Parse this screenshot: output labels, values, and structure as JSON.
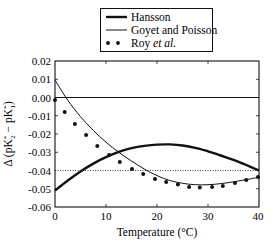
{
  "chart_data": {
    "type": "line",
    "title": "",
    "xlabel": "Temperature (°C)",
    "ylabel": "Δ (pK2* − pK1*)",
    "xlim": [
      0,
      40
    ],
    "ylim": [
      -0.06,
      0.02
    ],
    "xticks": [
      "0",
      "10",
      "20",
      "30",
      "40"
    ],
    "yticks": [
      "0.02",
      "0.01",
      "0.00",
      "-0.01",
      "-0.02",
      "-0.03",
      "-0.04",
      "-0.05",
      "-0.06"
    ],
    "reference_lines": [
      {
        "y": 0.0,
        "style": "solid"
      },
      {
        "y": -0.04,
        "style": "dotted"
      }
    ],
    "legend": {
      "position": "top-center",
      "entries": [
        "Hansson",
        "Goyet and Poisson",
        "Roy et al."
      ]
    },
    "series": [
      {
        "name": "Hansson",
        "style": "thick-line",
        "x": [
          0,
          2.5,
          5,
          7.5,
          10,
          12.5,
          15,
          17.5,
          20,
          22.5,
          25,
          27.5,
          30,
          32.5,
          35,
          37.5,
          40
        ],
        "values": [
          -0.051,
          -0.0455,
          -0.0405,
          -0.0362,
          -0.0327,
          -0.0298,
          -0.0278,
          -0.0265,
          -0.0258,
          -0.0257,
          -0.0263,
          -0.0276,
          -0.0295,
          -0.0318,
          -0.0342,
          -0.037,
          -0.04
        ]
      },
      {
        "name": "Goyet and Poisson",
        "style": "thin-line",
        "x": [
          0,
          2.5,
          5,
          7.5,
          10,
          12.5,
          15,
          17.5,
          20,
          22.5,
          25,
          27.5,
          30,
          32.5,
          35,
          37.5,
          40
        ],
        "values": [
          0.0095,
          -0.0015,
          -0.0105,
          -0.018,
          -0.0245,
          -0.03,
          -0.0348,
          -0.0392,
          -0.0428,
          -0.0455,
          -0.047,
          -0.0478,
          -0.0478,
          -0.0472,
          -0.0462,
          -0.045,
          -0.0437
        ]
      },
      {
        "name": "Roy et al.",
        "style": "dots",
        "x": [
          0,
          1.9,
          3.9,
          6.1,
          8.3,
          10.6,
          12.7,
          15.1,
          17.3,
          19.6,
          21.8,
          24.1,
          26.3,
          28.4,
          30.8,
          32.9,
          35.3,
          37.5,
          39.8
        ],
        "values": [
          -0.0014,
          -0.008,
          -0.0145,
          -0.0205,
          -0.0266,
          -0.0315,
          -0.0353,
          -0.0392,
          -0.0419,
          -0.0447,
          -0.0463,
          -0.0477,
          -0.049,
          -0.0493,
          -0.049,
          -0.0485,
          -0.0468,
          -0.0452,
          -0.0436
        ]
      }
    ]
  },
  "legend": {
    "items": [
      {
        "label": "Hansson"
      },
      {
        "label": "Goyet and Poisson"
      },
      {
        "label_main": "Roy ",
        "label_italic": "et al."
      }
    ]
  },
  "axes": {
    "xlabel": "Temperature (°C)",
    "ylabel_prefix": "Δ (pK",
    "ylabel_sub1": "2",
    "ylabel_sup1": "*",
    "ylabel_mid": " − pK",
    "ylabel_sub2": "1",
    "ylabel_sup2": "*",
    "ylabel_suffix": ")",
    "xticks": [
      "0",
      "10",
      "20",
      "30",
      "40"
    ],
    "yticks": [
      "0.02",
      "0.01",
      "0.00",
      "-0.01",
      "-0.02",
      "-0.03",
      "-0.04",
      "-0.05",
      "-0.06"
    ]
  }
}
